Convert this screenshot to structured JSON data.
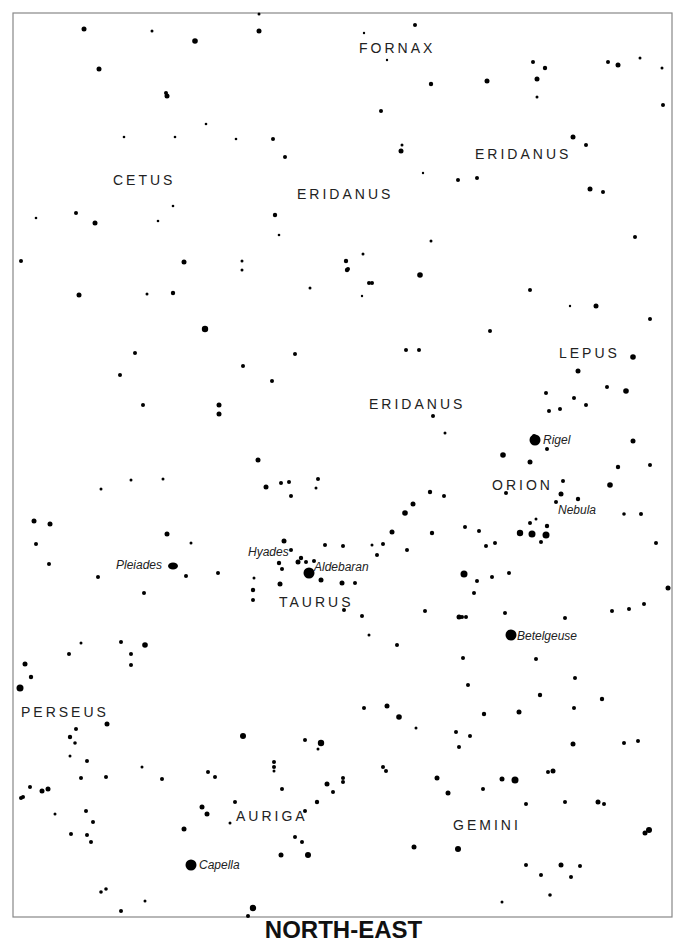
{
  "title": "NORTH-EAST",
  "frame": {
    "x": 13,
    "y": 13,
    "w": 659,
    "h": 904
  },
  "constellations": [
    {
      "name": "FORNAX",
      "x": 359,
      "y": 53
    },
    {
      "name": "CETUS",
      "x": 113,
      "y": 185
    },
    {
      "name": "ERIDANUS",
      "x": 475,
      "y": 159
    },
    {
      "name": "ERIDANUS",
      "x": 297,
      "y": 199
    },
    {
      "name": "LEPUS",
      "x": 559,
      "y": 358
    },
    {
      "name": "ERIDANUS",
      "x": 369,
      "y": 409
    },
    {
      "name": "ORION",
      "x": 492,
      "y": 490
    },
    {
      "name": "TAURUS",
      "x": 279,
      "y": 607
    },
    {
      "name": "PERSEUS",
      "x": 21,
      "y": 717
    },
    {
      "name": "AURIGA",
      "x": 236,
      "y": 821
    },
    {
      "name": "GEMINI",
      "x": 453,
      "y": 830
    }
  ],
  "objects": [
    {
      "name": "Rigel",
      "x": 543,
      "y": 444
    },
    {
      "name": "Nebula",
      "x": 558,
      "y": 514
    },
    {
      "name": "Hyades",
      "x": 248,
      "y": 556
    },
    {
      "name": "Aldebaran",
      "x": 314,
      "y": 571
    },
    {
      "name": "Pleiades",
      "x": 116,
      "y": 569
    },
    {
      "name": "Betelgeuse",
      "x": 517,
      "y": 640
    },
    {
      "name": "Capella",
      "x": 199,
      "y": 869
    }
  ],
  "stars": [
    [
      84,
      29,
      2.5
    ],
    [
      99,
      69,
      2.5
    ],
    [
      152,
      31,
      1.5
    ],
    [
      195,
      41,
      2.8
    ],
    [
      166,
      93,
      2
    ],
    [
      167,
      96,
      2.5
    ],
    [
      95,
      223,
      2.5
    ],
    [
      76,
      213,
      2
    ],
    [
      124,
      137,
      1.3
    ],
    [
      175,
      137,
      1.3
    ],
    [
      36,
      218,
      1.3
    ],
    [
      275,
      215,
      2.2
    ],
    [
      279,
      235,
      1.3
    ],
    [
      259,
      14,
      1.5
    ],
    [
      259,
      31,
      2.5
    ],
    [
      285,
      157,
      2
    ],
    [
      273,
      139,
      2
    ],
    [
      236,
      139,
      1.3
    ],
    [
      206,
      124,
      1.3
    ],
    [
      173,
      206,
      1.3
    ],
    [
      158,
      221,
      1.3
    ],
    [
      415,
      25,
      2
    ],
    [
      364,
      33,
      1.2
    ],
    [
      387,
      60,
      1.2
    ],
    [
      431,
      84,
      2.2
    ],
    [
      381,
      111,
      2
    ],
    [
      401,
      151,
      2.5
    ],
    [
      402,
      145,
      1.5
    ],
    [
      423,
      173,
      1.2
    ],
    [
      458,
      180,
      2
    ],
    [
      477,
      178,
      2
    ],
    [
      487,
      81,
      2.5
    ],
    [
      533,
      62,
      2
    ],
    [
      545,
      68,
      2.2
    ],
    [
      537,
      79,
      2.5
    ],
    [
      537,
      97,
      1.5
    ],
    [
      573,
      137,
      2.5
    ],
    [
      586,
      145,
      2
    ],
    [
      608,
      62,
      2
    ],
    [
      618,
      65,
      2.5
    ],
    [
      640,
      58,
      1.5
    ],
    [
      663,
      105,
      2
    ],
    [
      662,
      68,
      1.5
    ],
    [
      603,
      192,
      2
    ],
    [
      590,
      189,
      2.5
    ],
    [
      635,
      237,
      2
    ],
    [
      570,
      306,
      1.2
    ],
    [
      21,
      261,
      2
    ],
    [
      79,
      295,
      2.5
    ],
    [
      147,
      294,
      1.5
    ],
    [
      173,
      293,
      2.2
    ],
    [
      184,
      262,
      2.5
    ],
    [
      205,
      329,
      3.2
    ],
    [
      242,
      261,
      1.5
    ],
    [
      295,
      354,
      2
    ],
    [
      310,
      288,
      1.5
    ],
    [
      347,
      270,
      2.2
    ],
    [
      372,
      283,
      2
    ],
    [
      362,
      296,
      1.2
    ],
    [
      242,
      270,
      1.5
    ],
    [
      346,
      261,
      2.2
    ],
    [
      363,
      254,
      1.5
    ],
    [
      135,
      353,
      2
    ],
    [
      120,
      375,
      2
    ],
    [
      143,
      405,
      2
    ],
    [
      219,
      405,
      2.5
    ],
    [
      219,
      414,
      2.5
    ],
    [
      272,
      381,
      2
    ],
    [
      243,
      366,
      2
    ],
    [
      101,
      489,
      1.5
    ],
    [
      131,
      480,
      1.5
    ],
    [
      163,
      479,
      1.5
    ],
    [
      348,
      269,
      2
    ],
    [
      369,
      283,
      2
    ],
    [
      420,
      275,
      2.8
    ],
    [
      431,
      241,
      1.5
    ],
    [
      406,
      350,
      2
    ],
    [
      419,
      350,
      2
    ],
    [
      490,
      331,
      2
    ],
    [
      530,
      290,
      2
    ],
    [
      596,
      306,
      2.5
    ],
    [
      578,
      371,
      2.5
    ],
    [
      633,
      357,
      2.8
    ],
    [
      626,
      391,
      2.8
    ],
    [
      650,
      319,
      2
    ],
    [
      607,
      387,
      2
    ],
    [
      586,
      405,
      2
    ],
    [
      574,
      398,
      2
    ],
    [
      560,
      409,
      2
    ],
    [
      546,
      393,
      2
    ],
    [
      549,
      411,
      2
    ],
    [
      534,
      436,
      2
    ],
    [
      530,
      462,
      2.5
    ],
    [
      503,
      455,
      2.8
    ],
    [
      433,
      416,
      2
    ],
    [
      445,
      433,
      1.5
    ],
    [
      506,
      493,
      2
    ],
    [
      610,
      485,
      2.8
    ],
    [
      633,
      441,
      2.5
    ],
    [
      650,
      465,
      2
    ],
    [
      618,
      467,
      2.2
    ],
    [
      34,
      521,
      2.5
    ],
    [
      50,
      524,
      2.5
    ],
    [
      36,
      544,
      2
    ],
    [
      98,
      577,
      2
    ],
    [
      121,
      642,
      2
    ],
    [
      131,
      654,
      2
    ],
    [
      145,
      645,
      2.8
    ],
    [
      144,
      593,
      2
    ],
    [
      167,
      534,
      2.5
    ],
    [
      186,
      576,
      2
    ],
    [
      191,
      543,
      1.5
    ],
    [
      218,
      573,
      2
    ],
    [
      284,
      541,
      2.5
    ],
    [
      291,
      550,
      2
    ],
    [
      301,
      558,
      2.2
    ],
    [
      298,
      562,
      2.5
    ],
    [
      306,
      562,
      2
    ],
    [
      279,
      563,
      2.2
    ],
    [
      282,
      569,
      2
    ],
    [
      280,
      584,
      2.5
    ],
    [
      254,
      578,
      1.5
    ],
    [
      253,
      590,
      2.2
    ],
    [
      253,
      600,
      2
    ],
    [
      266,
      487,
      2.5
    ],
    [
      281,
      483,
      2
    ],
    [
      289,
      482,
      2
    ],
    [
      316,
      488,
      1.5
    ],
    [
      318,
      479,
      2
    ],
    [
      314,
      561,
      2
    ],
    [
      291,
      496,
      2
    ],
    [
      258,
      460,
      2.5
    ],
    [
      325,
      545,
      2
    ],
    [
      343,
      546,
      2
    ],
    [
      372,
      545,
      1.5
    ],
    [
      377,
      555,
      2
    ],
    [
      321,
      580,
      2.5
    ],
    [
      342,
      583,
      2.5
    ],
    [
      355,
      583,
      2
    ],
    [
      344,
      610,
      2
    ],
    [
      362,
      616,
      2
    ],
    [
      369,
      635,
      1.5
    ],
    [
      383,
      544,
      2
    ],
    [
      392,
      532,
      2.5
    ],
    [
      405,
      513,
      2.8
    ],
    [
      413,
      504,
      2.5
    ],
    [
      407,
      550,
      2
    ],
    [
      430,
      492,
      2.2
    ],
    [
      444,
      496,
      2
    ],
    [
      432,
      533,
      2.2
    ],
    [
      465,
      527,
      2
    ],
    [
      479,
      531,
      2
    ],
    [
      486,
      546,
      2
    ],
    [
      495,
      543,
      2
    ],
    [
      464,
      574,
      3.5
    ],
    [
      477,
      581,
      2
    ],
    [
      474,
      593,
      2
    ],
    [
      492,
      577,
      2
    ],
    [
      509,
      573,
      2
    ],
    [
      520,
      533,
      3.2
    ],
    [
      532,
      534,
      3.5
    ],
    [
      546,
      535,
      3.5
    ],
    [
      547,
      526,
      2.2
    ],
    [
      541,
      542,
      2
    ],
    [
      530,
      523,
      2
    ],
    [
      536,
      519,
      1.5
    ],
    [
      561,
      494,
      2.5
    ],
    [
      556,
      502,
      2
    ],
    [
      563,
      481,
      2
    ],
    [
      547,
      449,
      2
    ],
    [
      578,
      499,
      2.2
    ],
    [
      624,
      514,
      1.8
    ],
    [
      641,
      514,
      2
    ],
    [
      656,
      543,
      2
    ],
    [
      668,
      588,
      2.5
    ],
    [
      644,
      604,
      2
    ],
    [
      629,
      609,
      2
    ],
    [
      612,
      611,
      2
    ],
    [
      459,
      617,
      2.5
    ],
    [
      462,
      617,
      2
    ],
    [
      466,
      617,
      2
    ],
    [
      505,
      613,
      2
    ],
    [
      511,
      635,
      3.5
    ],
    [
      536,
      659,
      2
    ],
    [
      565,
      618,
      2
    ],
    [
      575,
      678,
      2
    ],
    [
      540,
      695,
      2.2
    ],
    [
      573,
      744,
      2.5
    ],
    [
      638,
      741,
      2
    ],
    [
      649,
      830,
      3
    ],
    [
      645,
      833,
      2.5
    ],
    [
      624,
      743,
      2
    ],
    [
      602,
      699,
      2.2
    ],
    [
      574,
      708,
      2
    ],
    [
      484,
      714,
      2.2
    ],
    [
      470,
      736,
      2
    ],
    [
      416,
      728,
      1.5
    ],
    [
      456,
      732,
      2
    ],
    [
      364,
      708,
      2
    ],
    [
      399,
      717,
      2.8
    ],
    [
      397,
      645,
      2
    ],
    [
      425,
      611,
      2
    ],
    [
      463,
      658,
      2
    ],
    [
      468,
      685,
      2
    ],
    [
      25,
      664,
      2.5
    ],
    [
      20,
      688,
      3.5
    ],
    [
      31,
      677,
      2.2
    ],
    [
      49,
      564,
      2
    ],
    [
      69,
      654,
      2
    ],
    [
      81,
      643,
      1.5
    ],
    [
      131,
      665,
      2
    ],
    [
      107,
      724,
      2.5
    ],
    [
      76,
      729,
      2
    ],
    [
      70,
      737,
      2.2
    ],
    [
      75,
      743,
      1.8
    ],
    [
      87,
      761,
      2
    ],
    [
      106,
      777,
      2
    ],
    [
      142,
      767,
      1.5
    ],
    [
      70,
      756,
      1.5
    ],
    [
      81,
      778,
      2
    ],
    [
      42,
      791,
      2.5
    ],
    [
      30,
      787,
      2
    ],
    [
      48,
      789,
      2.5
    ],
    [
      23,
      797,
      2
    ],
    [
      21,
      798,
      2
    ],
    [
      86,
      811,
      2
    ],
    [
      93,
      822,
      2
    ],
    [
      71,
      834,
      2
    ],
    [
      87,
      835,
      2
    ],
    [
      91,
      842,
      2
    ],
    [
      55,
      814,
      1.5
    ],
    [
      106,
      889,
      1.8
    ],
    [
      101,
      892,
      1.8
    ],
    [
      121,
      911,
      2
    ],
    [
      145,
      901,
      1.5
    ],
    [
      243,
      736,
      3
    ],
    [
      162,
      779,
      2
    ],
    [
      202,
      807,
      2.5
    ],
    [
      207,
      814,
      2.5
    ],
    [
      184,
      829,
      2.5
    ],
    [
      230,
      823,
      1.5
    ],
    [
      235,
      802,
      2
    ],
    [
      208,
      772,
      2
    ],
    [
      215,
      777,
      2
    ],
    [
      274,
      762,
      2
    ],
    [
      274,
      767,
      2
    ],
    [
      274,
      771,
      1.5
    ],
    [
      282,
      789,
      2
    ],
    [
      305,
      740,
      2
    ],
    [
      321,
      743,
      3.2
    ],
    [
      318,
      749,
      1.5
    ],
    [
      305,
      811,
      2
    ],
    [
      295,
      837,
      2
    ],
    [
      281,
      855,
      2.5
    ],
    [
      302,
      842,
      2
    ],
    [
      308,
      855,
      3
    ],
    [
      317,
      802,
      2.2
    ],
    [
      327,
      784,
      2.5
    ],
    [
      343,
      778,
      2
    ],
    [
      387,
      706,
      2.5
    ],
    [
      383,
      767,
      2
    ],
    [
      386,
      771,
      2
    ],
    [
      343,
      782,
      2
    ],
    [
      333,
      792,
      2
    ],
    [
      253,
      908,
      3.2
    ],
    [
      248,
      916,
      2
    ],
    [
      437,
      778,
      2.5
    ],
    [
      448,
      793,
      2.5
    ],
    [
      459,
      747,
      2
    ],
    [
      502,
      779,
      2.5
    ],
    [
      515,
      780,
      3.5
    ],
    [
      553,
      771,
      2.5
    ],
    [
      548,
      772,
      2
    ],
    [
      565,
      802,
      2
    ],
    [
      598,
      802,
      2.5
    ],
    [
      604,
      804,
      2
    ],
    [
      561,
      865,
      2.5
    ],
    [
      571,
      877,
      2
    ],
    [
      526,
      865,
      2
    ],
    [
      526,
      804,
      2
    ],
    [
      414,
      847,
      2.5
    ],
    [
      458,
      849,
      3
    ],
    [
      483,
      789,
      2
    ],
    [
      519,
      712,
      2.5
    ],
    [
      541,
      875,
      2
    ],
    [
      550,
      895,
      1.8
    ],
    [
      502,
      902,
      1.5
    ],
    [
      580,
      866,
      2
    ]
  ]
}
